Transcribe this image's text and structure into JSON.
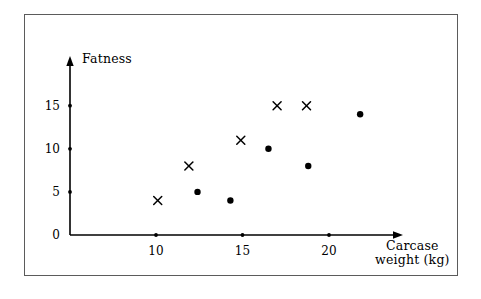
{
  "figure": {
    "background_color": "#ffffff",
    "frame_color": "#5b5b5b",
    "ink_color": "#000000"
  },
  "chart_data": {
    "type": "scatter",
    "title": "",
    "xlabel": "Carcase weight (kg)",
    "xlabel_line1": "Carcase",
    "xlabel_line2": "weight (kg)",
    "ylabel": "Fatness",
    "xlim": [
      7.0,
      22.8
    ],
    "ylim": [
      0,
      18.4
    ],
    "xticks": [
      10,
      15,
      20
    ],
    "xtick_labels": [
      "10",
      "15",
      "20"
    ],
    "yticks": [
      0,
      5,
      10,
      15
    ],
    "ytick_labels": [
      "0",
      "5",
      "10",
      "15"
    ],
    "grid": false,
    "legend": "none",
    "axis_style": "arrow-tipped L axes",
    "series": [
      {
        "name": "cross-series",
        "marker": "x",
        "color": "#000000",
        "points": [
          {
            "x": 10.1,
            "y": 4
          },
          {
            "x": 11.9,
            "y": 8
          },
          {
            "x": 14.9,
            "y": 11
          },
          {
            "x": 17.0,
            "y": 15
          },
          {
            "x": 18.7,
            "y": 15
          }
        ]
      },
      {
        "name": "dot-series",
        "marker": "circle",
        "color": "#000000",
        "points": [
          {
            "x": 12.4,
            "y": 5
          },
          {
            "x": 14.3,
            "y": 4
          },
          {
            "x": 16.5,
            "y": 10
          },
          {
            "x": 18.8,
            "y": 8
          },
          {
            "x": 21.8,
            "y": 14
          }
        ]
      }
    ]
  }
}
